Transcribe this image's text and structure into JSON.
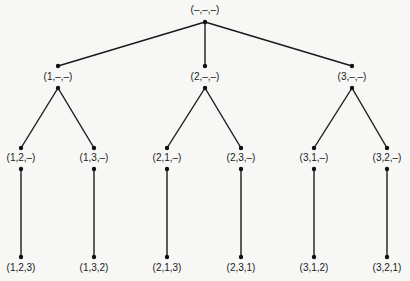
{
  "diagram": {
    "type": "permutation-tree",
    "root": {
      "label": "(–,–,–)"
    },
    "level1": [
      {
        "label": "(1,–,–)"
      },
      {
        "label": "(2,–,–)"
      },
      {
        "label": "(3,–,–)"
      }
    ],
    "level2": [
      {
        "parent": 0,
        "label": "(1,2,–)"
      },
      {
        "parent": 0,
        "label": "(1,3,–)"
      },
      {
        "parent": 1,
        "label": "(2,1,–)"
      },
      {
        "parent": 1,
        "label": "(2,3,–)"
      },
      {
        "parent": 2,
        "label": "(3,1,–)"
      },
      {
        "parent": 2,
        "label": "(3,2,–)"
      }
    ],
    "leaves": [
      {
        "parent": 0,
        "label": "(1,2,3)"
      },
      {
        "parent": 1,
        "label": "(1,3,2)"
      },
      {
        "parent": 2,
        "label": "(2,1,3)"
      },
      {
        "parent": 3,
        "label": "(2,3,1)"
      },
      {
        "parent": 4,
        "label": "(3,1,2)"
      },
      {
        "parent": 5,
        "label": "(3,2,1)"
      }
    ]
  }
}
